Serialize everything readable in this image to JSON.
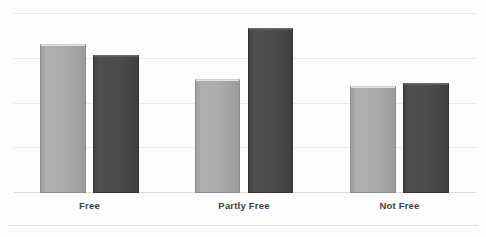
{
  "chart_data": {
    "type": "bar",
    "title": "",
    "subtitle": "",
    "xlabel": "",
    "ylabel": "",
    "categories": [
      "Free",
      "Partly Free",
      "Not Free"
    ],
    "series": [
      {
        "name": "series-1",
        "color": "#a9a9a9",
        "values": [
          3.33,
          2.55,
          2.39
        ]
      },
      {
        "name": "series-2",
        "color": "#4a4a4a",
        "values": [
          3.08,
          3.69,
          2.46
        ]
      }
    ],
    "ylim": [
      0,
      4
    ],
    "y_gridlines": [
      1,
      2,
      3,
      4
    ],
    "grid": true,
    "y_tick_labels_visible": false,
    "legend": "none",
    "legend_position": "none",
    "annotations": []
  },
  "axis": {
    "category_labels": [
      {
        "text": "Free"
      },
      {
        "text": "Partly Free"
      },
      {
        "text": "Not Free"
      }
    ]
  },
  "colors": {
    "series_light": "#a9a9a9",
    "series_dark": "#4a4a4a",
    "gridline": "#e9e9e9",
    "baseline": "#dcdcdc",
    "label_text": "#3f3f3f",
    "background": "#fdfdfd"
  }
}
